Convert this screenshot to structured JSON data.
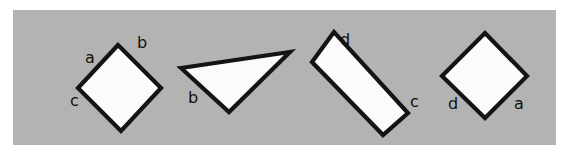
{
  "canvas": {
    "width": 573,
    "height": 155,
    "background_color": "#ffffff",
    "plate_color": "#b3b3b3",
    "stroke_color": "#141414",
    "shape_fill_color": "#fbfbfb",
    "label_color": "#101010"
  },
  "figure": {
    "shapes": [
      {
        "id": "shape-1",
        "kind": "diamond",
        "points": "118,45 78,88 121,131 161,88",
        "labels": [
          {
            "id": "label-a-1",
            "text": "a",
            "x": 85,
            "y": 50
          },
          {
            "id": "label-b-1",
            "text": "b",
            "x": 137,
            "y": 35
          },
          {
            "id": "label-c-1",
            "text": "c",
            "x": 70,
            "y": 93
          }
        ]
      },
      {
        "id": "shape-2",
        "kind": "triangle",
        "points": "181,68 290,52 229,112",
        "labels": [
          {
            "id": "label-b-2",
            "text": "b",
            "x": 188,
            "y": 90
          }
        ]
      },
      {
        "id": "shape-3",
        "kind": "rectangle",
        "points": "334,32 312,62 383,135 408,113",
        "labels": [
          {
            "id": "label-d-3",
            "text": "d",
            "x": 340,
            "y": 32
          },
          {
            "id": "label-c-3",
            "text": "c",
            "x": 410,
            "y": 94
          }
        ]
      },
      {
        "id": "shape-4",
        "kind": "diamond",
        "points": "485,33 442,76 485,118 527,76"
      }
    ],
    "labels_extra": [
      {
        "id": "label-d-4",
        "text": "d",
        "x": 448,
        "y": 96
      },
      {
        "id": "label-a-4",
        "text": "a",
        "x": 514,
        "y": 96
      }
    ]
  }
}
